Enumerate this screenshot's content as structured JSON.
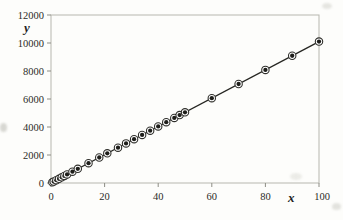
{
  "figure": {
    "background": "#fdfdfb",
    "frame_color": "#b7b7af",
    "tick_color": "#8d8d85",
    "label_color": "#2b2b27",
    "line_color": "#262622",
    "marker_core_color": "#1e1e1a",
    "marker_ring_color": "#ffffff",
    "marker_edge_color": "#30302c"
  },
  "chart_data": {
    "type": "scatter",
    "title": "",
    "xlabel": "x",
    "ylabel": "y",
    "xlim": [
      0,
      100
    ],
    "ylim": [
      0,
      12000
    ],
    "xticks": [
      0,
      20,
      40,
      60,
      80,
      100
    ],
    "yticks": [
      0,
      2000,
      4000,
      6000,
      8000,
      10000,
      12000
    ],
    "grid": false,
    "legend_position": "none",
    "marker_style": "filled-circle-with-white-ring",
    "x": [
      0.5,
      1,
      2,
      3,
      4,
      5,
      6,
      8,
      10,
      14,
      18,
      21,
      25,
      28,
      31,
      34,
      37,
      40,
      43,
      46,
      48,
      50,
      60,
      70,
      80,
      90,
      100
    ],
    "y": [
      50,
      100,
      200,
      300,
      405,
      505,
      610,
      810,
      1010,
      1415,
      1820,
      2120,
      2525,
      2830,
      3130,
      3435,
      3740,
      4040,
      4345,
      4645,
      4850,
      5050,
      6060,
      7070,
      8080,
      9090,
      10100
    ],
    "fit_line": {
      "x0": 0,
      "y0": 0,
      "x1": 100,
      "y1": 10100
    }
  }
}
